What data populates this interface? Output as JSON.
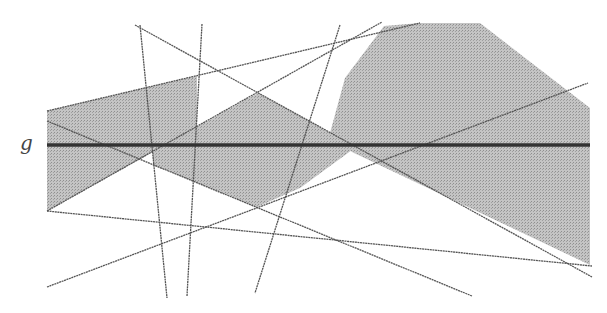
{
  "diagram": {
    "label_g": "g",
    "colors": {
      "fill": "#b8b8b8",
      "line": "#555555",
      "g_line": "#333333",
      "background": "#ffffff"
    },
    "g_line": {
      "x1": 47,
      "y1": 145,
      "x2": 590,
      "y2": 145
    },
    "lines": [
      {
        "name": "line-a",
        "x1": 47,
        "y1": 111,
        "x2": 420,
        "y2": 23
      },
      {
        "name": "line-b",
        "x1": 135,
        "y1": 25,
        "x2": 592,
        "y2": 277
      },
      {
        "name": "line-c",
        "x1": 47,
        "y1": 211,
        "x2": 382,
        "y2": 22
      },
      {
        "name": "line-d",
        "x1": 47,
        "y1": 287,
        "x2": 588,
        "y2": 83
      },
      {
        "name": "line-e",
        "x1": 47,
        "y1": 211,
        "x2": 592,
        "y2": 266
      },
      {
        "name": "line-f",
        "x1": 47,
        "y1": 121,
        "x2": 472,
        "y2": 296
      },
      {
        "name": "line-v1",
        "x1": 140,
        "y1": 25,
        "x2": 167,
        "y2": 298
      },
      {
        "name": "line-v2",
        "x1": 202,
        "y1": 24,
        "x2": 187,
        "y2": 296
      },
      {
        "name": "line-v3",
        "x1": 340,
        "y1": 25,
        "x2": 255,
        "y2": 293
      }
    ],
    "regions": [
      {
        "name": "region-left",
        "points": "47,111 197,76 197,128 153,152 47,211"
      },
      {
        "name": "region-middle",
        "points": "153,152 258,93 330,133 352,150 300,188 257,207 153,165"
      },
      {
        "name": "region-right",
        "points": "330,133 345,78 384,26 420,23 480,23 590,108 590,265 352,152"
      }
    ]
  }
}
